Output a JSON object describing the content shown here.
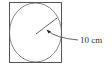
{
  "diagram": {
    "type": "circle-inscribed-in-square",
    "radius_label": "10 cm",
    "colors": {
      "stroke": "#444444",
      "circle": "#666666",
      "text": "#333333",
      "background": "#ffffff"
    }
  }
}
